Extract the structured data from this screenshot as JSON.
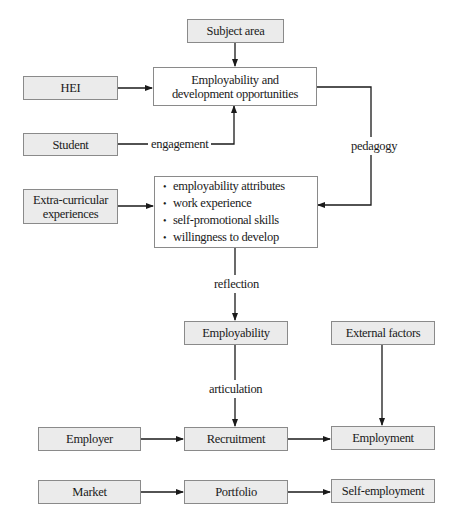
{
  "diagram": {
    "nodes": {
      "subject_area": "Subject area",
      "employability_opportunities": "Employability and development opportunities",
      "hei": "HEI",
      "student": "Student",
      "extra_curricular": "Extra-curricular experiences",
      "attributes": [
        "employability attributes",
        "work experience",
        "self-promotional skills",
        "willingness to develop"
      ],
      "employability": "Employability",
      "external_factors": "External factors",
      "employer": "Employer",
      "recruitment": "Recruitment",
      "employment": "Employment",
      "market": "Market",
      "portfolio": "Portfolio",
      "self_employment": "Self-employment"
    },
    "edge_labels": {
      "engagement": "engagement",
      "pedagogy": "pedagogy",
      "reflection": "reflection",
      "articulation": "articulation"
    },
    "colors": {
      "box_fill": "#ebebeb",
      "box_border": "#8a8a8a",
      "line": "#1a1a1a"
    }
  }
}
